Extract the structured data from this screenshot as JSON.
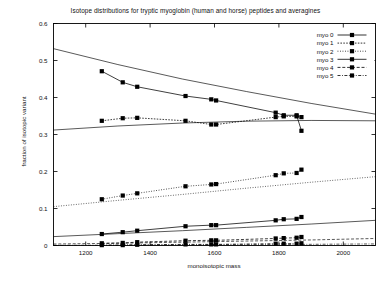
{
  "chart_data": {
    "type": "line",
    "title": "Isotope distributions for tryptic myoglobin (human and horse) peptides and averagines",
    "xlabel": "monoisotopic mass",
    "ylabel": "fraction of isotopic variant",
    "xlim": [
      1100,
      2100
    ],
    "ylim": [
      0,
      0.6
    ],
    "xticks": [
      1200,
      1400,
      1600,
      1800,
      2000
    ],
    "xtick_labels": [
      "1200",
      "1400",
      "1600",
      "1800",
      "2000"
    ],
    "yticks": [
      0,
      0.1,
      0.2,
      0.3,
      0.4,
      0.5,
      0.6
    ],
    "ytick_labels": [
      "0",
      "0.1",
      "0.2",
      "0.3",
      "0.4",
      "0.5",
      "0.6"
    ],
    "grid": false,
    "legend_position": "top-right",
    "marker": "filled-square",
    "series": [
      {
        "name": "myo 0",
        "style": "solid",
        "points": [
          {
            "x": 1250,
            "y": 0.471
          },
          {
            "x": 1315,
            "y": 0.441
          },
          {
            "x": 1360,
            "y": 0.429
          },
          {
            "x": 1510,
            "y": 0.404
          },
          {
            "x": 1590,
            "y": 0.395
          },
          {
            "x": 1605,
            "y": 0.392
          },
          {
            "x": 1790,
            "y": 0.359
          },
          {
            "x": 1815,
            "y": 0.352
          },
          {
            "x": 1855,
            "y": 0.352
          },
          {
            "x": 1870,
            "y": 0.31
          }
        ]
      },
      {
        "name": "myo 1",
        "style": "fine-dashed",
        "points": [
          {
            "x": 1250,
            "y": 0.337
          },
          {
            "x": 1315,
            "y": 0.344
          },
          {
            "x": 1360,
            "y": 0.345
          },
          {
            "x": 1510,
            "y": 0.337
          },
          {
            "x": 1590,
            "y": 0.327
          },
          {
            "x": 1605,
            "y": 0.327
          },
          {
            "x": 1790,
            "y": 0.347
          },
          {
            "x": 1815,
            "y": 0.349
          },
          {
            "x": 1855,
            "y": 0.349
          },
          {
            "x": 1870,
            "y": 0.347
          }
        ]
      },
      {
        "name": "myo 2",
        "style": "dotted",
        "points": [
          {
            "x": 1250,
            "y": 0.125
          },
          {
            "x": 1315,
            "y": 0.135
          },
          {
            "x": 1360,
            "y": 0.141
          },
          {
            "x": 1510,
            "y": 0.16
          },
          {
            "x": 1590,
            "y": 0.165
          },
          {
            "x": 1605,
            "y": 0.166
          },
          {
            "x": 1790,
            "y": 0.19
          },
          {
            "x": 1815,
            "y": 0.195
          },
          {
            "x": 1855,
            "y": 0.196
          },
          {
            "x": 1870,
            "y": 0.205
          }
        ]
      },
      {
        "name": "myo 3",
        "style": "solid",
        "points": [
          {
            "x": 1250,
            "y": 0.031
          },
          {
            "x": 1315,
            "y": 0.036
          },
          {
            "x": 1360,
            "y": 0.04
          },
          {
            "x": 1510,
            "y": 0.052
          },
          {
            "x": 1590,
            "y": 0.055
          },
          {
            "x": 1605,
            "y": 0.055
          },
          {
            "x": 1790,
            "y": 0.068
          },
          {
            "x": 1815,
            "y": 0.071
          },
          {
            "x": 1855,
            "y": 0.072
          },
          {
            "x": 1870,
            "y": 0.077
          }
        ]
      },
      {
        "name": "myo 4",
        "style": "dashed",
        "points": [
          {
            "x": 1250,
            "y": 0.006
          },
          {
            "x": 1315,
            "y": 0.007
          },
          {
            "x": 1360,
            "y": 0.009
          },
          {
            "x": 1510,
            "y": 0.013
          },
          {
            "x": 1590,
            "y": 0.014
          },
          {
            "x": 1605,
            "y": 0.014
          },
          {
            "x": 1790,
            "y": 0.019
          },
          {
            "x": 1815,
            "y": 0.02
          },
          {
            "x": 1855,
            "y": 0.021
          },
          {
            "x": 1870,
            "y": 0.023
          }
        ]
      },
      {
        "name": "myo 5",
        "style": "dash-dot",
        "points": [
          {
            "x": 1250,
            "y": 0.001
          },
          {
            "x": 1315,
            "y": 0.001
          },
          {
            "x": 1360,
            "y": 0.002
          },
          {
            "x": 1510,
            "y": 0.003
          },
          {
            "x": 1590,
            "y": 0.003
          },
          {
            "x": 1605,
            "y": 0.003
          },
          {
            "x": 1790,
            "y": 0.005
          },
          {
            "x": 1815,
            "y": 0.005
          },
          {
            "x": 1855,
            "y": 0.005
          },
          {
            "x": 1870,
            "y": 0.006
          }
        ]
      }
    ],
    "averagine_curves": [
      {
        "name": "averagine 0",
        "style": "solid",
        "points": [
          {
            "x": 1100,
            "y": 0.532
          },
          {
            "x": 1300,
            "y": 0.489
          },
          {
            "x": 1500,
            "y": 0.45
          },
          {
            "x": 1700,
            "y": 0.416
          },
          {
            "x": 1900,
            "y": 0.384
          },
          {
            "x": 2100,
            "y": 0.355
          }
        ]
      },
      {
        "name": "averagine 1",
        "style": "solid",
        "points": [
          {
            "x": 1100,
            "y": 0.312
          },
          {
            "x": 1300,
            "y": 0.323
          },
          {
            "x": 1500,
            "y": 0.331
          },
          {
            "x": 1700,
            "y": 0.336
          },
          {
            "x": 1900,
            "y": 0.338
          },
          {
            "x": 2100,
            "y": 0.337
          }
        ]
      },
      {
        "name": "averagine 2",
        "style": "dotted",
        "points": [
          {
            "x": 1100,
            "y": 0.105
          },
          {
            "x": 1300,
            "y": 0.122
          },
          {
            "x": 1500,
            "y": 0.138
          },
          {
            "x": 1700,
            "y": 0.155
          },
          {
            "x": 1900,
            "y": 0.171
          },
          {
            "x": 2100,
            "y": 0.186
          }
        ]
      },
      {
        "name": "averagine 3",
        "style": "solid",
        "points": [
          {
            "x": 1100,
            "y": 0.024
          },
          {
            "x": 1300,
            "y": 0.032
          },
          {
            "x": 1500,
            "y": 0.04
          },
          {
            "x": 1700,
            "y": 0.049
          },
          {
            "x": 1900,
            "y": 0.058
          },
          {
            "x": 2100,
            "y": 0.068
          }
        ]
      },
      {
        "name": "averagine 4",
        "style": "dashed",
        "points": [
          {
            "x": 1100,
            "y": 0.004
          },
          {
            "x": 1300,
            "y": 0.006
          },
          {
            "x": 1500,
            "y": 0.009
          },
          {
            "x": 1700,
            "y": 0.012
          },
          {
            "x": 1900,
            "y": 0.015
          },
          {
            "x": 2100,
            "y": 0.019
          }
        ]
      },
      {
        "name": "averagine 5",
        "style": "dash-dot",
        "points": [
          {
            "x": 1100,
            "y": 0.0005
          },
          {
            "x": 1300,
            "y": 0.0009
          },
          {
            "x": 1500,
            "y": 0.0015
          },
          {
            "x": 1700,
            "y": 0.0023
          },
          {
            "x": 1900,
            "y": 0.0032
          },
          {
            "x": 2100,
            "y": 0.0043
          }
        ]
      }
    ],
    "legend": [
      {
        "label": "myo 0",
        "style": "solid"
      },
      {
        "label": "myo 1",
        "style": "fine-dashed"
      },
      {
        "label": "myo 2",
        "style": "dotted"
      },
      {
        "label": "myo 3",
        "style": "solid"
      },
      {
        "label": "myo 4",
        "style": "dashed"
      },
      {
        "label": "myo 5",
        "style": "dash-dot"
      }
    ],
    "colors": {
      "line": "#000000",
      "axis": "#000000",
      "background": "#ffffff",
      "text": "#111111"
    }
  }
}
